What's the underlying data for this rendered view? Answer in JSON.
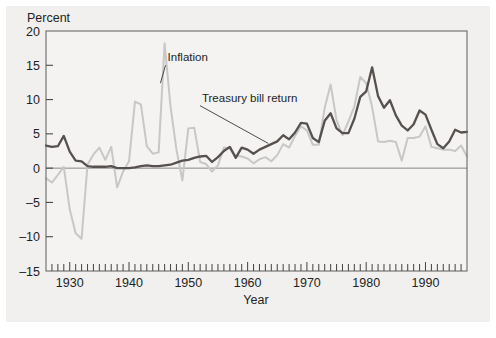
{
  "figure": {
    "background_color": "#f1f0ee",
    "plot_background_color": "#f4f3f1",
    "frame_color": "#6a6a6a"
  },
  "chart_data": {
    "type": "line",
    "title": "",
    "subtitle": "",
    "xlabel": "Year",
    "ylabel": "Percent",
    "ylabel_position": "top-left",
    "xlim": [
      1926,
      1997
    ],
    "ylim": [
      -15,
      20
    ],
    "yticks": [
      -15,
      -10,
      -5,
      0,
      5,
      10,
      15,
      20
    ],
    "ytick_labels": [
      "–15",
      "–10",
      "–5",
      "0",
      "5",
      "10",
      "15",
      "20"
    ],
    "xticks": [
      1930,
      1940,
      1950,
      1960,
      1970,
      1980,
      1990
    ],
    "xtick_labels": [
      "1930",
      "1940",
      "1950",
      "1960",
      "1970",
      "1980",
      "1990"
    ],
    "x_minor_tick_interval": 1,
    "grid": false,
    "legend": "inline-annotations",
    "zero_line": true,
    "annotations": [
      {
        "name": "inflation-annotation",
        "text": "Inflation",
        "label_x": 1946.5,
        "label_y": 15.6,
        "leader_to_x": 1945.3,
        "leader_to_y": 12.4
      },
      {
        "name": "treasury-annotation",
        "text": "Treasury bill return",
        "label_x": 1952.3,
        "label_y": 9.7,
        "leader_to_x": 1963.5,
        "leader_to_y": 3.6
      }
    ],
    "series": [
      {
        "name": "Inflation",
        "color": "#c7c7c7",
        "line_width": 2.0,
        "x": [
          1926,
          1927,
          1928,
          1929,
          1930,
          1931,
          1932,
          1933,
          1934,
          1935,
          1936,
          1937,
          1938,
          1939,
          1940,
          1941,
          1942,
          1943,
          1944,
          1945,
          1946,
          1947,
          1948,
          1949,
          1950,
          1951,
          1952,
          1953,
          1954,
          1955,
          1956,
          1957,
          1958,
          1959,
          1960,
          1961,
          1962,
          1963,
          1964,
          1965,
          1966,
          1967,
          1968,
          1969,
          1970,
          1971,
          1972,
          1973,
          1974,
          1975,
          1976,
          1977,
          1978,
          1979,
          1980,
          1981,
          1982,
          1983,
          1984,
          1985,
          1986,
          1987,
          1988,
          1989,
          1990,
          1991,
          1992,
          1993,
          1994,
          1995,
          1996,
          1997
        ],
        "values": [
          -1.5,
          -2.1,
          -1.0,
          0.2,
          -6.0,
          -9.5,
          -10.3,
          0.5,
          2.0,
          3.0,
          1.2,
          3.1,
          -2.8,
          -0.5,
          1.0,
          9.7,
          9.3,
          3.2,
          2.1,
          2.3,
          18.2,
          9.0,
          2.7,
          -1.8,
          5.8,
          5.9,
          0.9,
          0.6,
          -0.5,
          0.4,
          3.0,
          2.9,
          1.8,
          1.7,
          1.4,
          0.7,
          1.3,
          1.6,
          1.0,
          1.9,
          3.5,
          3.0,
          4.7,
          6.1,
          5.5,
          3.4,
          3.4,
          8.8,
          12.2,
          7.0,
          4.8,
          6.8,
          9.0,
          13.3,
          12.4,
          8.9,
          3.9,
          3.8,
          4.0,
          3.8,
          1.1,
          4.4,
          4.4,
          4.6,
          6.1,
          3.1,
          2.9,
          2.7,
          2.7,
          2.5,
          3.3,
          1.7
        ]
      },
      {
        "name": "Treasury bill return",
        "color": "#56504e",
        "line_width": 2.3,
        "x": [
          1926,
          1927,
          1928,
          1929,
          1930,
          1931,
          1932,
          1933,
          1934,
          1935,
          1936,
          1937,
          1938,
          1939,
          1940,
          1941,
          1942,
          1943,
          1944,
          1945,
          1946,
          1947,
          1948,
          1949,
          1950,
          1951,
          1952,
          1953,
          1954,
          1955,
          1956,
          1957,
          1958,
          1959,
          1960,
          1961,
          1962,
          1963,
          1964,
          1965,
          1966,
          1967,
          1968,
          1969,
          1970,
          1971,
          1972,
          1973,
          1974,
          1975,
          1976,
          1977,
          1978,
          1979,
          1980,
          1981,
          1982,
          1983,
          1984,
          1985,
          1986,
          1987,
          1988,
          1989,
          1990,
          1991,
          1992,
          1993,
          1994,
          1995,
          1996,
          1997
        ],
        "values": [
          3.3,
          3.1,
          3.2,
          4.7,
          2.4,
          1.1,
          1.0,
          0.3,
          0.2,
          0.2,
          0.2,
          0.3,
          0.0,
          0.0,
          0.0,
          0.1,
          0.3,
          0.4,
          0.3,
          0.3,
          0.4,
          0.5,
          0.8,
          1.1,
          1.2,
          1.5,
          1.7,
          1.8,
          0.9,
          1.6,
          2.5,
          3.1,
          1.5,
          3.0,
          2.7,
          2.1,
          2.7,
          3.1,
          3.5,
          3.9,
          4.8,
          4.2,
          5.2,
          6.6,
          6.5,
          4.4,
          3.8,
          6.9,
          8.0,
          5.8,
          5.1,
          5.1,
          7.2,
          10.4,
          11.2,
          14.7,
          10.5,
          8.8,
          9.9,
          7.7,
          6.2,
          5.5,
          6.4,
          8.4,
          7.8,
          5.6,
          3.5,
          2.9,
          3.9,
          5.6,
          5.2,
          5.3
        ]
      }
    ]
  }
}
